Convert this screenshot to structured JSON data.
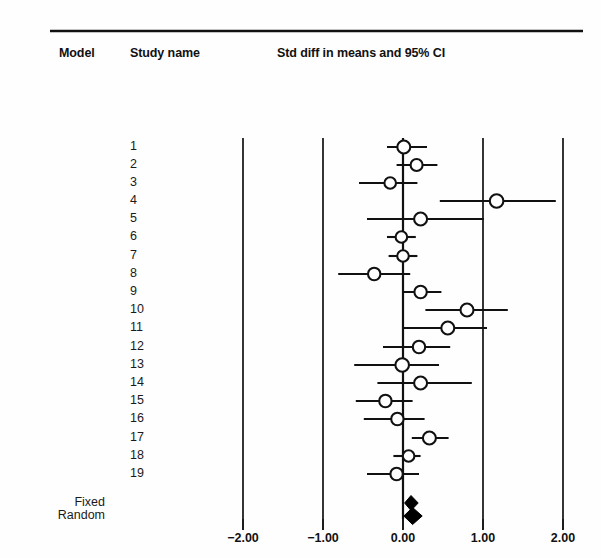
{
  "header": {
    "model_label": "Model",
    "study_label": "Study name",
    "effect_label": "Std diff in means and 95% CI"
  },
  "axis": {
    "ticks": [
      "−2.00",
      "−1.00",
      "0.00",
      "1.00",
      "2.00"
    ],
    "tick_values": [
      -2,
      -1,
      0,
      1,
      2
    ],
    "tick_x_px": [
      243,
      323,
      403,
      483,
      563
    ],
    "zero_x_px": 403,
    "px_per_unit": 80
  },
  "summary_rows": [
    {
      "model": "Fixed",
      "y_px": 503
    },
    {
      "model": "Random",
      "y_px": 516
    }
  ],
  "chart_data": {
    "type": "forest",
    "title": "Std diff in means and 95% CI",
    "xlabel": "Std diff in means",
    "ylabel": "Study name",
    "xlim": [
      -2.4,
      2.4
    ],
    "grid": "vertical-lines-at-ticks",
    "legend": "none",
    "xticks": [
      -2,
      -1,
      0,
      1,
      2
    ],
    "xticklabels": [
      "−2.00",
      "−1.00",
      "0.00",
      "1.00",
      "2.00"
    ],
    "marker": "open-circle",
    "summary_marker": "filled-diamond",
    "categories": [
      "1",
      "2",
      "3",
      "4",
      "5",
      "6",
      "7",
      "8",
      "9",
      "10",
      "11",
      "12",
      "13",
      "14",
      "15",
      "16",
      "17",
      "18",
      "19"
    ],
    "studies": [
      {
        "name": "1",
        "y_px": 147,
        "effect": 0.01,
        "lower": -0.2,
        "upper": 0.3,
        "marker_px": 6.5
      },
      {
        "name": "2",
        "y_px": 165,
        "effect": 0.17,
        "lower": -0.08,
        "upper": 0.43,
        "marker_px": 6.0
      },
      {
        "name": "3",
        "y_px": 183,
        "effect": -0.16,
        "lower": -0.55,
        "upper": 0.18,
        "marker_px": 5.8
      },
      {
        "name": "4",
        "y_px": 201,
        "effect": 1.17,
        "lower": 0.46,
        "upper": 1.91,
        "marker_px": 6.8
      },
      {
        "name": "5",
        "y_px": 219,
        "effect": 0.22,
        "lower": -0.45,
        "upper": 1.01,
        "marker_px": 6.5
      },
      {
        "name": "6",
        "y_px": 237,
        "effect": -0.02,
        "lower": -0.2,
        "upper": 0.16,
        "marker_px": 5.8
      },
      {
        "name": "7",
        "y_px": 256,
        "effect": 0.0,
        "lower": -0.18,
        "upper": 0.18,
        "marker_px": 5.8
      },
      {
        "name": "8",
        "y_px": 274,
        "effect": -0.36,
        "lower": -0.81,
        "upper": 0.09,
        "marker_px": 6.2
      },
      {
        "name": "9",
        "y_px": 292,
        "effect": 0.22,
        "lower": 0.0,
        "upper": 0.48,
        "marker_px": 6.2
      },
      {
        "name": "10",
        "y_px": 310,
        "effect": 0.8,
        "lower": 0.28,
        "upper": 1.31,
        "marker_px": 6.5
      },
      {
        "name": "11",
        "y_px": 328,
        "effect": 0.56,
        "lower": 0.0,
        "upper": 1.05,
        "marker_px": 6.5
      },
      {
        "name": "12",
        "y_px": 347,
        "effect": 0.2,
        "lower": -0.25,
        "upper": 0.59,
        "marker_px": 6.2
      },
      {
        "name": "13",
        "y_px": 365,
        "effect": -0.01,
        "lower": -0.61,
        "upper": 0.45,
        "marker_px": 6.8
      },
      {
        "name": "14",
        "y_px": 383,
        "effect": 0.22,
        "lower": -0.32,
        "upper": 0.86,
        "marker_px": 6.5
      },
      {
        "name": "15",
        "y_px": 401,
        "effect": -0.22,
        "lower": -0.59,
        "upper": 0.12,
        "marker_px": 6.2
      },
      {
        "name": "16",
        "y_px": 419,
        "effect": -0.07,
        "lower": -0.49,
        "upper": 0.27,
        "marker_px": 6.2
      },
      {
        "name": "17",
        "y_px": 438,
        "effect": 0.33,
        "lower": 0.11,
        "upper": 0.57,
        "marker_px": 6.5
      },
      {
        "name": "18",
        "y_px": 456,
        "effect": 0.07,
        "lower": -0.12,
        "upper": 0.22,
        "marker_px": 5.8
      },
      {
        "name": "19",
        "y_px": 474,
        "effect": -0.08,
        "lower": -0.45,
        "upper": 0.2,
        "marker_px": 6.2
      }
    ],
    "summary": [
      {
        "model": "Fixed",
        "y_px": 503,
        "effect": 0.1,
        "lower": 0.02,
        "upper": 0.19,
        "half_height_px": 7.5
      },
      {
        "model": "Random",
        "y_px": 516,
        "effect": 0.12,
        "lower": 0.01,
        "upper": 0.24,
        "half_height_px": 8.5
      }
    ]
  }
}
